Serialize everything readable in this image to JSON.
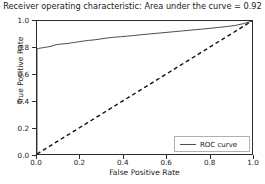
{
  "chart_data": {
    "type": "line",
    "title": "Receiver operating characteristic: Area under the curve = 0.92",
    "title_prefix": "Receiver operating characteristic:",
    "title_auc_text": "Area under the curve = 0.92",
    "auc": 0.92,
    "xlabel": "False Positive Rate",
    "ylabel": "True Positive Rate",
    "xlim": [
      0.0,
      1.0
    ],
    "ylim": [
      0.0,
      1.0
    ],
    "grid": false,
    "legend_position": "lower right",
    "xticks": [
      "0.0",
      "0.2",
      "0.4",
      "0.6",
      "0.8",
      "1.0"
    ],
    "xtick_values": [
      0.0,
      0.2,
      0.4,
      0.6,
      0.8,
      1.0
    ],
    "yticks": [
      "0.0",
      "0.2",
      "0.4",
      "0.6",
      "0.8",
      "1.0"
    ],
    "ytick_values": [
      0.0,
      0.2,
      0.4,
      0.6,
      0.8,
      1.0
    ],
    "series": [
      {
        "name": "ROC curve",
        "style": "solid",
        "color": "#4d4d4d",
        "x": [
          0.0,
          0.0,
          0.01,
          0.03,
          0.05,
          0.07,
          0.09,
          0.11,
          0.13,
          0.15,
          0.17,
          0.19,
          0.21,
          0.24,
          0.27,
          0.3,
          0.33,
          0.36,
          0.39,
          0.42,
          0.45,
          0.48,
          0.52,
          0.56,
          0.6,
          0.64,
          0.68,
          0.72,
          0.76,
          0.8,
          0.84,
          0.88,
          0.92,
          0.96,
          1.0
        ],
        "y": [
          0.0,
          0.79,
          0.795,
          0.8,
          0.805,
          0.812,
          0.822,
          0.826,
          0.829,
          0.833,
          0.838,
          0.843,
          0.848,
          0.854,
          0.859,
          0.866,
          0.873,
          0.878,
          0.882,
          0.886,
          0.891,
          0.896,
          0.902,
          0.908,
          0.914,
          0.92,
          0.926,
          0.932,
          0.938,
          0.944,
          0.951,
          0.958,
          0.966,
          0.98,
          1.0
        ]
      },
      {
        "name": "chance diagonal",
        "style": "dashed",
        "color": "#111111",
        "x": [
          0.0,
          1.0
        ],
        "y": [
          0.0,
          1.0
        ]
      }
    ]
  },
  "legend": {
    "entries": [
      {
        "label": "ROC curve",
        "color": "#4d4d4d",
        "style": "solid"
      }
    ]
  }
}
